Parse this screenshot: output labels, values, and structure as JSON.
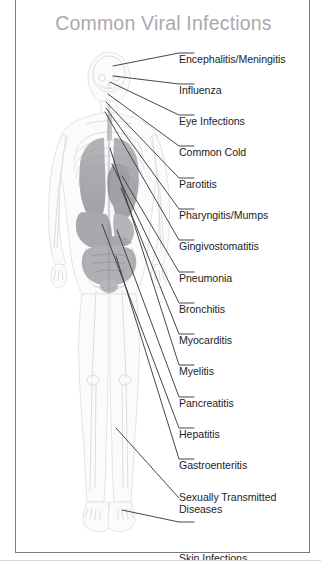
{
  "card": {
    "title": "Common Viral Infections",
    "title_color": "#a9a9ad",
    "border_color": "#7a7a7a",
    "background": "#ffffff"
  },
  "figure": {
    "name": "human-anatomy-figure",
    "outline_color": "#e8e8ea",
    "skeleton_color": "#dedee2",
    "organ_color": "#909094",
    "lung_color": "#8e8e92",
    "leader_line_color": "#3c3c40"
  },
  "labels": [
    {
      "id": "encephalitis-meningitis",
      "text": "Encephalitis/Meningitis",
      "y": 3,
      "anchor_x": 97,
      "anchor_y": 68
    },
    {
      "id": "influenza",
      "text": "Influenza",
      "y": 34,
      "anchor_x": 97,
      "anchor_y": 78
    },
    {
      "id": "eye-infections",
      "text": "Eye Infections",
      "y": 65,
      "anchor_x": 94,
      "anchor_y": 84
    },
    {
      "id": "common-cold",
      "text": "Common Cold",
      "y": 96,
      "anchor_x": 92,
      "anchor_y": 96
    },
    {
      "id": "parotitis",
      "text": "Parotitis",
      "y": 128,
      "anchor_x": 90,
      "anchor_y": 104
    },
    {
      "id": "pharyngitis-mumps",
      "text": "Pharyngitis/Mumps",
      "y": 159,
      "anchor_x": 90,
      "anchor_y": 110
    },
    {
      "id": "gingivostomatitis",
      "text": "Gingivostomatitis",
      "y": 190,
      "anchor_x": 89,
      "anchor_y": 113
    },
    {
      "id": "pneumonia",
      "text": "Pneumonia",
      "y": 222,
      "anchor_x": 105,
      "anchor_y": 178
    },
    {
      "id": "bronchitis",
      "text": "Bronchitis",
      "y": 253,
      "anchor_x": 95,
      "anchor_y": 165
    },
    {
      "id": "myocarditis",
      "text": "Myocarditis",
      "y": 284,
      "anchor_x": 104,
      "anchor_y": 190
    },
    {
      "id": "myelitis",
      "text": "Myelitis",
      "y": 315,
      "anchor_x": 93,
      "anchor_y": 150
    },
    {
      "id": "pancreatitis",
      "text": "Pancreatitis",
      "y": 347,
      "anchor_x": 100,
      "anchor_y": 230
    },
    {
      "id": "hepatitis",
      "text": "Hepatitis",
      "y": 378,
      "anchor_x": 86,
      "anchor_y": 225
    },
    {
      "id": "gastroenteritis",
      "text": "Gastroenteritis",
      "y": 409,
      "anchor_x": 99,
      "anchor_y": 258
    },
    {
      "id": "sexually-transmitted-diseases",
      "text": "Sexually Transmitted\nDiseases",
      "y": 441,
      "anchor_x": 0,
      "anchor_y": 0
    },
    {
      "id": "skin-infections",
      "text": "Skin Infections",
      "y": 502,
      "anchor_x": 106,
      "anchor_y": 509
    }
  ]
}
